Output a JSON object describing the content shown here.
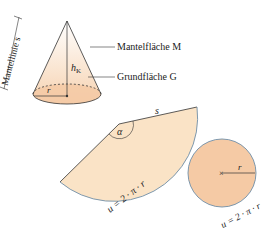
{
  "labels": {
    "slant_height": "Mantellinie s",
    "height": "h",
    "height_sub": "K",
    "radius_cone": "r",
    "lateral_surface": "Mantelfläche M",
    "base_area": "Grundfläche G",
    "sector_s": "s",
    "sector_angle": "α",
    "sector_arc": "u = 2 · π · r",
    "circle_radius": "r",
    "circle_circumference": "u = 2 · π · r"
  },
  "colors": {
    "fill_base": "#f4c9a4",
    "fill_sector": "#fae3c6",
    "fill_circle": "#f5caa5",
    "stroke": "#333333",
    "arc_stroke": "#6f8fa8"
  }
}
